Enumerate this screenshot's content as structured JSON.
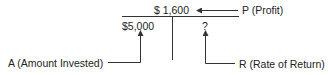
{
  "diagram": {
    "type": "profit-rate-amount-triangle",
    "profit_value": "$ 1,600",
    "amount_value": "$5,000",
    "rate_value": "?",
    "labels": {
      "profit": "P (Profit)",
      "amount": "A (Amount Invested)",
      "rate": "R (Rate of Return)"
    },
    "colors": {
      "line": "#333333",
      "text": "#222222",
      "background": "#ffffff"
    }
  }
}
